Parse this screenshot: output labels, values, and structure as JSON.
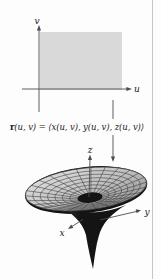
{
  "figure": {
    "domain_plane": {
      "v_label": "v",
      "u_label": "u"
    },
    "formula": {
      "vector_symbol": "r",
      "expression": "(u, v) = ⟨x(u, v), y(u, v), z(u, v)⟩"
    },
    "surface_axes": {
      "x_label": "x",
      "y_label": "y",
      "z_label": "z"
    },
    "colors": {
      "background": "#fdfdfd",
      "domain_fill": "#d9d9d9",
      "axis_line": "#4d4d4d",
      "mesh_line": "#3c3c3c",
      "surface_light": "#e4e4e4",
      "surface_mid": "#bdbdbd",
      "surface_dark": "#8f8f8f",
      "funnel_dark": "#141414",
      "page_edge": "#c6c6c6",
      "text": "#222222"
    }
  }
}
